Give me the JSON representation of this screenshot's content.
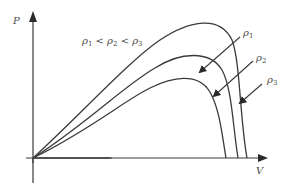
{
  "diagram": {
    "type": "P-V curves",
    "axes": {
      "y_label": "P",
      "x_label": "V"
    },
    "condition": {
      "symbol": "ρ",
      "s1": "1",
      "lt1": " < ",
      "s2": "2",
      "lt2": " < ",
      "s3": "3"
    },
    "curves": [
      {
        "name": "ρ1",
        "symbol": "ρ",
        "sub": "1"
      },
      {
        "name": "ρ2",
        "symbol": "ρ",
        "sub": "2"
      },
      {
        "name": "ρ3",
        "symbol": "ρ",
        "sub": "3"
      }
    ],
    "colors": {
      "line": "#3a3a3a",
      "text": "#4a4a4a"
    }
  }
}
